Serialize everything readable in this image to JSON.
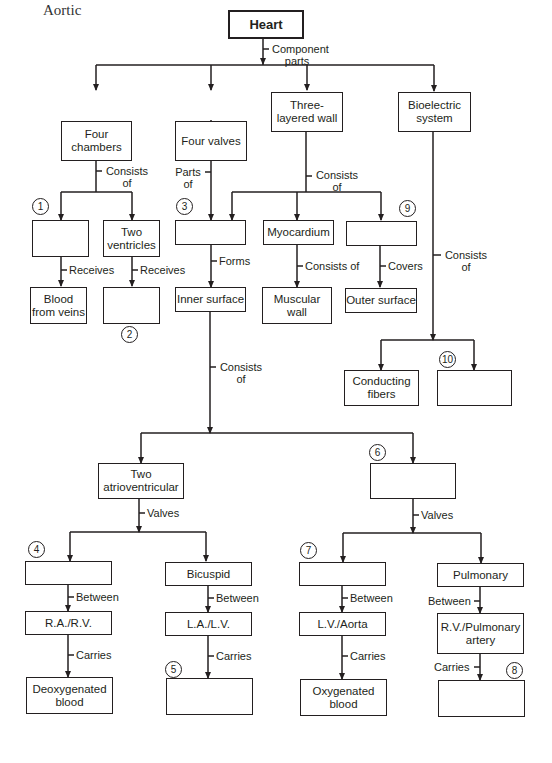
{
  "title": "Aortic",
  "nodes": {
    "heart": "Heart",
    "four_chambers": "Four chambers",
    "four_valves": "Four valves",
    "three_layered_wall": "Three-layered wall",
    "bioelectric_system": "Bioelectric system",
    "blank_1": "",
    "two_ventricles": "Two ventricles",
    "blood_from_veins": "Blood from veins",
    "blank_2": "",
    "blank_3": "",
    "inner_surface": "Inner surface",
    "myocardium": "Myocardium",
    "muscular_wall": "Muscular wall",
    "blank_9": "",
    "outer_surface": "Outer surface",
    "conducting_fibers": "Conducting fibers",
    "blank_10": "",
    "two_atrioventricular": "Two atrioventricular",
    "blank_6": "",
    "blank_4": "",
    "bicuspid": "Bicuspid",
    "ra_rv": "R.A./R.V.",
    "la_lv": "L.A./L.V.",
    "deoxygenated_blood": "Deoxygenated blood",
    "blank_5": "",
    "blank_7": "",
    "pulmonary": "Pulmonary",
    "lv_aorta": "L.V./Aorta",
    "rv_pulmonary_artery": "R.V./Pulmonary artery",
    "oxygenated_blood": "Oxygenated blood",
    "blank_8": ""
  },
  "edge_labels": {
    "component_parts": "Component parts",
    "chambers_consists_of": "Consists of",
    "valves_parts_of": "Parts of",
    "wall_consists_of": "Consists of",
    "bio_consists_of": "Consists of",
    "receives_1": "Receives",
    "receives_2": "Receives",
    "forms": "Forms",
    "myo_consists_of": "Consists of",
    "covers": "Covers",
    "inner_consists_of": "Consists of",
    "av_valves": "Valves",
    "six_valves": "Valves",
    "between_4": "Between",
    "between_bicuspid": "Between",
    "between_7": "Between",
    "between_pulmonary": "Between",
    "carries_ra": "Carries",
    "carries_la": "Carries",
    "carries_lv": "Carries",
    "carries_rv": "Carries"
  },
  "numbers": {
    "n1": "1",
    "n2": "2",
    "n3": "3",
    "n4": "4",
    "n5": "5",
    "n6": "6",
    "n7": "7",
    "n8": "8",
    "n9": "9",
    "n10": "10"
  }
}
